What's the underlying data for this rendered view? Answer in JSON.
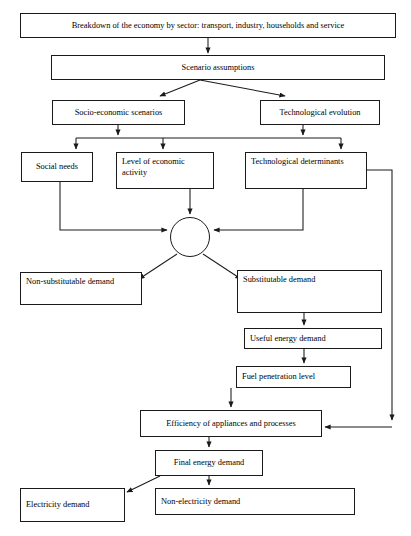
{
  "diagram": {
    "type": "flowchart",
    "orientation": "top-to-bottom",
    "line_color": "#1a1a1a",
    "box_fill": "#ffffff",
    "text_color": "#000000",
    "canvas": {
      "width": 411,
      "height": 536
    }
  },
  "nodes": {
    "breakdown": {
      "label": "Breakdown of the economy by sector: transport, industry, households and service",
      "x": 20,
      "y": 13,
      "w": 376,
      "h": 25,
      "align": "center"
    },
    "scenario_assumptions": {
      "label": "Scenario assumptions",
      "x": 51,
      "y": 55,
      "w": 334,
      "h": 25,
      "align": "center"
    },
    "socio_economic": {
      "label": "Socio-economic scenarios",
      "x": 52,
      "y": 100,
      "w": 133,
      "h": 25,
      "align": "center"
    },
    "technological_evolution": {
      "label": "Technological evolution",
      "x": 260,
      "y": 100,
      "w": 120,
      "h": 25,
      "align": "center"
    },
    "social_needs": {
      "label": "Social needs",
      "x": 21,
      "y": 152,
      "w": 72,
      "h": 30,
      "align": "center"
    },
    "level_economic": {
      "label": "Level of economic activity",
      "x": 116,
      "y": 152,
      "w": 98,
      "h": 37,
      "align": "topleft"
    },
    "technological_determinants": {
      "label": "Technological determinants",
      "x": 245,
      "y": 152,
      "w": 122,
      "h": 37,
      "align": "topleft"
    },
    "non_substitutable": {
      "label": "Non-substitutable demand",
      "x": 20,
      "y": 272,
      "w": 122,
      "h": 33,
      "align": "topleft"
    },
    "substitutable": {
      "label": "Substitutable demand",
      "x": 237,
      "y": 270,
      "w": 145,
      "h": 43,
      "align": "topleft"
    },
    "useful_energy": {
      "label": "Useful energy demand",
      "x": 244,
      "y": 328,
      "w": 138,
      "h": 21,
      "align": "midleft"
    },
    "fuel_penetration": {
      "label": "Fuel penetration level",
      "x": 236,
      "y": 366,
      "w": 115,
      "h": 22,
      "align": "midleft"
    },
    "efficiency": {
      "label": "Efficiency of appliances and processes",
      "x": 140,
      "y": 410,
      "w": 182,
      "h": 27,
      "align": "center"
    },
    "final_energy": {
      "label": "Final energy demand",
      "x": 155,
      "y": 450,
      "w": 108,
      "h": 26,
      "align": "center"
    },
    "electricity": {
      "label": "Electricity demand",
      "x": 20,
      "y": 488,
      "w": 105,
      "h": 34,
      "align": "midleft"
    },
    "non_electricity": {
      "label": "Non-electricity demand",
      "x": 155,
      "y": 488,
      "w": 200,
      "h": 27,
      "align": "midleft"
    }
  },
  "junction": {
    "name": "aggregation-node",
    "cx": 190,
    "cy": 237,
    "r": 20
  },
  "connectors": [
    {
      "name": "breakdown-to-scenario",
      "from": "breakdown",
      "to": "scenario_assumptions",
      "style": "straight-vertical-arrow"
    },
    {
      "name": "scenario-to-socio-economic",
      "from": "scenario_assumptions",
      "to": "socio_economic",
      "style": "diagonal-arrow"
    },
    {
      "name": "scenario-to-technological-evolution",
      "from": "scenario_assumptions",
      "to": "technological_evolution",
      "style": "diagonal-arrow"
    },
    {
      "name": "socio-economic-to-bus",
      "from": "socio_economic",
      "to": "distribution-bus",
      "style": "vertical-arrow"
    },
    {
      "name": "technological-evolution-to-bus",
      "from": "technological_evolution",
      "to": "distribution-bus",
      "style": "vertical-arrow"
    },
    {
      "name": "bus-to-social-needs",
      "from": "distribution-bus",
      "to": "social_needs",
      "style": "vertical-arrow"
    },
    {
      "name": "bus-to-level-economic",
      "from": "distribution-bus",
      "to": "level_economic",
      "style": "vertical-arrow"
    },
    {
      "name": "bus-to-technological-determinants",
      "from": "distribution-bus",
      "to": "technological_determinants",
      "style": "vertical-arrow"
    },
    {
      "name": "social-needs-to-junction",
      "from": "social_needs",
      "to": "junction",
      "style": "elbow-arrow"
    },
    {
      "name": "level-economic-to-junction",
      "from": "level_economic",
      "to": "junction",
      "style": "vertical-arrow"
    },
    {
      "name": "technological-determinants-to-junction",
      "from": "technological_determinants",
      "to": "junction",
      "style": "elbow-arrow"
    },
    {
      "name": "junction-to-non-substitutable",
      "from": "junction",
      "to": "non_substitutable",
      "style": "diagonal-arrow"
    },
    {
      "name": "junction-to-substitutable",
      "from": "junction",
      "to": "substitutable",
      "style": "diagonal-arrow"
    },
    {
      "name": "substitutable-to-useful-energy",
      "from": "substitutable",
      "to": "useful_energy",
      "style": "vertical-arrow"
    },
    {
      "name": "useful-energy-to-fuel-penetration",
      "from": "useful_energy",
      "to": "fuel_penetration",
      "style": "vertical-arrow"
    },
    {
      "name": "fuel-penetration-to-efficiency",
      "from": "fuel_penetration",
      "to": "efficiency",
      "style": "vertical-arrow"
    },
    {
      "name": "technological-determinants-feedback-to-efficiency",
      "from": "technological_determinants",
      "to": "efficiency",
      "style": "right-side-feedback-elbow"
    },
    {
      "name": "efficiency-to-final-energy",
      "from": "efficiency",
      "to": "final_energy",
      "style": "vertical-arrow"
    },
    {
      "name": "final-energy-to-electricity",
      "from": "final_energy",
      "to": "electricity",
      "style": "diagonal-arrow"
    },
    {
      "name": "final-energy-to-non-electricity",
      "from": "final_energy",
      "to": "non_electricity",
      "style": "vertical-arrow"
    }
  ]
}
